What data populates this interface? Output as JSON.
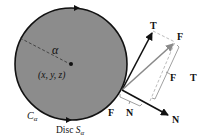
{
  "diagram": {
    "disc": {
      "fill": "#8c8c8c",
      "stroke": "#111111",
      "cx": 71,
      "cy": 64,
      "r": 56
    },
    "labels": {
      "alpha": "α",
      "center_point": "(x, y, z)",
      "curve": "C",
      "curve_sub": "α",
      "disc_prefix": "Disc ",
      "disc_symbol": "S",
      "disc_sub": "α",
      "vector_T_tip": "T",
      "vector_F_tip": "F",
      "bracket_F": "F",
      "bracket_T": "T",
      "bracket_N": "N",
      "vector_N_tip": "N",
      "F_at_boundary": "F"
    },
    "colors": {
      "vector_dark": "#111111",
      "vector_F": "#8a8a8a",
      "dashed": "#aaaaaa"
    }
  }
}
